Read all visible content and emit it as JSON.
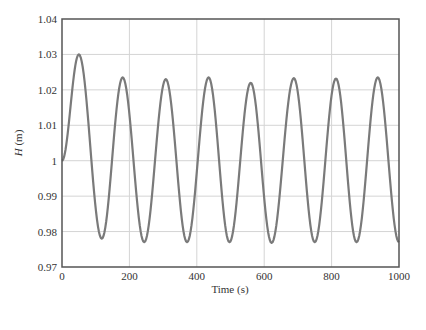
{
  "chart_data": {
    "type": "line",
    "title": "",
    "xlabel": "Time (s)",
    "ylabel_italic": "H",
    "ylabel_unit": " (m)",
    "xlim": [
      0,
      1000
    ],
    "ylim": [
      0.97,
      1.04
    ],
    "grid": true,
    "legend": null,
    "x_ticks": [
      0,
      200,
      400,
      600,
      800,
      1000
    ],
    "x_tick_labels": [
      "0",
      "200",
      "400",
      "600",
      "800",
      "1000"
    ],
    "y_ticks": [
      0.97,
      0.98,
      0.99,
      1.0,
      1.01,
      1.02,
      1.03,
      1.04
    ],
    "y_tick_labels": [
      "0.97",
      "0.98",
      "0.99",
      "1",
      "1.01",
      "1.02",
      "1.03",
      "1.04"
    ],
    "series": [
      {
        "name": "H",
        "color": "#7a7a7a",
        "extrema": [
          {
            "t": 0,
            "H": 1.0
          },
          {
            "t": 50,
            "H": 1.03
          },
          {
            "t": 118,
            "H": 0.978
          },
          {
            "t": 180,
            "H": 1.0235
          },
          {
            "t": 244,
            "H": 0.977
          },
          {
            "t": 308,
            "H": 1.023
          },
          {
            "t": 371,
            "H": 0.977
          },
          {
            "t": 435,
            "H": 1.0235
          },
          {
            "t": 497,
            "H": 0.977
          },
          {
            "t": 560,
            "H": 1.022
          },
          {
            "t": 622,
            "H": 0.9768
          },
          {
            "t": 688,
            "H": 1.0233
          },
          {
            "t": 750,
            "H": 0.977
          },
          {
            "t": 813,
            "H": 1.0232
          },
          {
            "t": 874,
            "H": 0.977
          },
          {
            "t": 937,
            "H": 1.0235
          },
          {
            "t": 1000,
            "H": 0.977
          }
        ]
      }
    ]
  },
  "colors": {
    "frame": "#555555",
    "grid": "#d4d4d4",
    "line": "#7a7a7a"
  }
}
